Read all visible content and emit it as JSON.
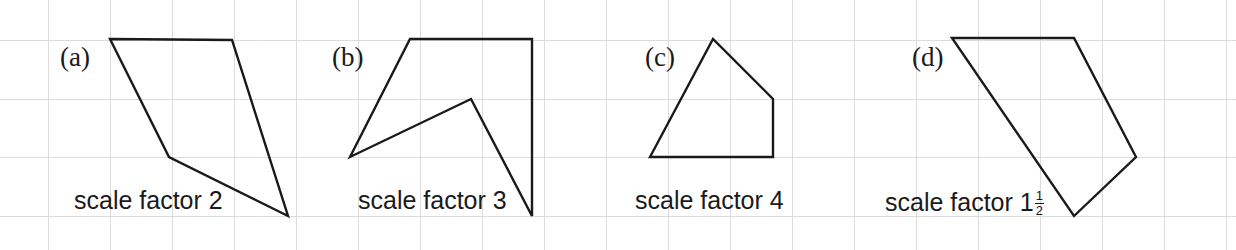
{
  "figure": {
    "width": 1236,
    "height": 250,
    "background_color": "#ffffff",
    "grid": {
      "line_color": "#dcdcdc",
      "line_width": 1,
      "x_positions": [
        48,
        110,
        172,
        234,
        296,
        358,
        420,
        482,
        544,
        606,
        668,
        730,
        792,
        854,
        916,
        978,
        1040,
        1102,
        1164,
        1226
      ],
      "y_positions": [
        40,
        99,
        157,
        216
      ]
    },
    "shape_stroke_color": "#1a1a1a",
    "shape_stroke_width": 2.4
  },
  "panels": [
    {
      "id": "a",
      "letter": "(a)",
      "letter_x": 60,
      "letter_y": 44,
      "caption": "scale factor 2",
      "caption_prefix": "scale factor 2",
      "caption_has_fraction": false,
      "caption_x": 74,
      "caption_y": 188,
      "shape_points": "110,39 232,40 288,216 169,157",
      "vertices": [
        [
          110,
          39
        ],
        [
          232,
          40
        ],
        [
          288,
          216
        ],
        [
          169,
          157
        ]
      ]
    },
    {
      "id": "b",
      "letter": "(b)",
      "letter_x": 332,
      "letter_y": 44,
      "caption": "scale factor 3",
      "caption_prefix": "scale factor 3",
      "caption_has_fraction": false,
      "caption_x": 358,
      "caption_y": 188,
      "shape_points": "350,157 410,39 532,39 532,216 471,99",
      "vertices": [
        [
          350,
          157
        ],
        [
          410,
          39
        ],
        [
          532,
          39
        ],
        [
          532,
          216
        ],
        [
          471,
          99
        ]
      ]
    },
    {
      "id": "c",
      "letter": "(c)",
      "letter_x": 645,
      "letter_y": 44,
      "caption": "scale factor 4",
      "caption_prefix": "scale factor 4",
      "caption_has_fraction": false,
      "caption_x": 635,
      "caption_y": 188,
      "shape_points": "650,157 713,39 773,99 773,157",
      "vertices": [
        [
          650,
          157
        ],
        [
          713,
          39
        ],
        [
          773,
          99
        ],
        [
          773,
          157
        ]
      ]
    },
    {
      "id": "d",
      "letter": "(d)",
      "letter_x": 912,
      "letter_y": 44,
      "caption": "scale factor 1 1/2",
      "caption_prefix": "scale factor 1",
      "caption_has_fraction": true,
      "fraction_numerator": "1",
      "fraction_denominator": "2",
      "caption_x": 885,
      "caption_y": 188,
      "shape_points": "952,38 1074,38 1136,157 1074,216",
      "vertices": [
        [
          952,
          38
        ],
        [
          1074,
          38
        ],
        [
          1136,
          157
        ],
        [
          1074,
          216
        ]
      ]
    }
  ]
}
